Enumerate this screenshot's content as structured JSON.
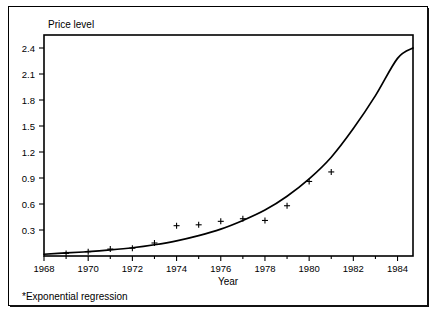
{
  "figure": {
    "y_axis_title": "Price level",
    "x_axis_title": "Year",
    "footnote": "*Exponential regression"
  },
  "chart_data": {
    "type": "scatter",
    "title": "",
    "subtitle": "",
    "xlabel": "Year",
    "ylabel": "Price level",
    "xlim": [
      1968,
      1984.7
    ],
    "ylim": [
      0,
      2.55
    ],
    "grid": false,
    "legend": null,
    "annotations": [
      "*Exponential regression"
    ],
    "x_ticks": [
      1968,
      1970,
      1972,
      1974,
      1976,
      1978,
      1980,
      1982,
      1984
    ],
    "x_tick_labels": [
      "1968",
      "1970",
      "1972",
      "1974",
      "1976",
      "1978",
      "1980",
      "1982",
      "1984"
    ],
    "x_minor_ticks": [
      1969,
      1971,
      1973,
      1975,
      1977,
      1979,
      1981,
      1983
    ],
    "y_ticks": [
      0.3,
      0.6,
      0.9,
      1.2,
      1.5,
      1.8,
      2.1,
      2.4
    ],
    "y_tick_labels": [
      "0.3",
      "0.6",
      "0.9",
      "1.2",
      "1.5",
      "1.8",
      "2.1",
      "2.4"
    ],
    "series": [
      {
        "name": "Observed price level",
        "type": "scatter",
        "marker": "plus",
        "color": "#000000",
        "x": [
          1969,
          1970,
          1971,
          1972,
          1973,
          1974,
          1975,
          1976,
          1977,
          1978,
          1979,
          1980,
          1981
        ],
        "values": [
          0.03,
          0.05,
          0.08,
          0.09,
          0.15,
          0.35,
          0.36,
          0.4,
          0.43,
          0.41,
          0.58,
          0.86,
          0.97
        ]
      },
      {
        "name": "Exponential regression",
        "type": "line",
        "color": "#000000",
        "x": [
          1968.0,
          1969.0,
          1970.0,
          1971.0,
          1972.0,
          1973.0,
          1974.0,
          1975.0,
          1976.0,
          1977.0,
          1978.0,
          1979.0,
          1980.0,
          1981.0,
          1982.0,
          1983.0,
          1984.0,
          1984.7
        ],
        "values": [
          0.02,
          0.035,
          0.05,
          0.07,
          0.095,
          0.13,
          0.175,
          0.235,
          0.31,
          0.41,
          0.53,
          0.69,
          0.89,
          1.14,
          1.47,
          1.85,
          2.28,
          2.4
        ]
      }
    ]
  },
  "geometry": {
    "plot_left": 44,
    "plot_right": 413,
    "plot_top": 35,
    "plot_baseline": 256
  }
}
